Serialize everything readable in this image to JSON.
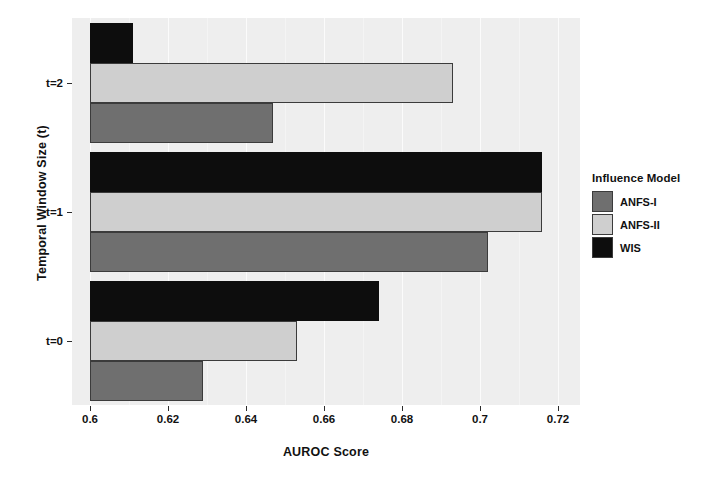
{
  "chart_data": {
    "type": "bar",
    "orientation": "horizontal",
    "title": "",
    "xlabel": "AUROC Score",
    "ylabel": "Temporal Window Size (t)",
    "categories": [
      "t=0",
      "t=1",
      "t=2"
    ],
    "xlim": [
      0.6,
      0.725
    ],
    "xticks": [
      "0.6",
      "0.62",
      "0.64",
      "0.66",
      "0.68",
      "0.7",
      "0.72"
    ],
    "xtick_values": [
      0.6,
      0.62,
      0.64,
      0.66,
      0.68,
      0.7,
      0.72
    ],
    "grid": true,
    "legend": {
      "title": "Influence Model",
      "position": "right",
      "entries": [
        "ANFS-I",
        "ANFS-II",
        "WIS"
      ]
    },
    "series": [
      {
        "name": "ANFS-I",
        "color": "#6f6f6f",
        "values": [
          0.629,
          0.702,
          0.647
        ]
      },
      {
        "name": "ANFS-II",
        "color": "#cfcfcf",
        "values": [
          0.653,
          0.716,
          0.693
        ]
      },
      {
        "name": "WIS",
        "color": "#0d0d0d",
        "values": [
          0.674,
          0.716,
          0.611
        ]
      }
    ]
  },
  "axes": {
    "x_title": "AUROC Score",
    "y_title": "Temporal Window Size (t)",
    "x_ticks": [
      "0.6",
      "0.62",
      "0.64",
      "0.66",
      "0.68",
      "0.7",
      "0.72"
    ],
    "y_ticks": [
      "t=2",
      "t=1",
      "t=0"
    ]
  },
  "legend": {
    "title": "Influence Model",
    "items": [
      {
        "label": "ANFS-I",
        "color": "#6f6f6f"
      },
      {
        "label": "ANFS-II",
        "color": "#cfcfcf"
      },
      {
        "label": "WIS",
        "color": "#0d0d0d"
      }
    ]
  },
  "style": {
    "panel_background": "#eeeeee",
    "grid_color": "#fbfbfb",
    "page_background": "#ffffff"
  }
}
